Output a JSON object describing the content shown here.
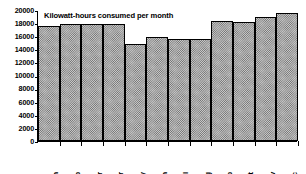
{
  "chart_data": {
    "type": "bar",
    "title": "Kilowatt-hours consumed per month",
    "xlabel": "",
    "ylabel": "",
    "categories": [
      "Jan",
      "Feb",
      "Mar",
      "Apr",
      "May",
      "Jun",
      "Jul",
      "Aug",
      "Sep",
      "Oct",
      "Nov",
      "Dec"
    ],
    "values": [
      17500,
      17900,
      17900,
      17900,
      14800,
      15950,
      15500,
      15550,
      18300,
      18200,
      19000,
      19500
    ],
    "series": [
      {
        "name": "Kilowatt-hours consumed per month",
        "values": [
          17500,
          17900,
          17900,
          17900,
          14800,
          15950,
          15500,
          15550,
          18300,
          18200,
          19000,
          19500
        ]
      }
    ],
    "ylim": [
      0,
      20000
    ],
    "ytick_step": 2000,
    "ytick_labels": [
      "20000",
      "18000",
      "16000",
      "14000",
      "12000",
      "10000",
      "8000",
      "6000",
      "4000",
      "2000",
      "0"
    ],
    "ytick_values": [
      20000,
      18000,
      16000,
      14000,
      12000,
      10000,
      8000,
      6000,
      4000,
      2000,
      0
    ],
    "grid": false,
    "legend": null,
    "legend_position": "none",
    "bar_style": {
      "fill": "hatched-gray",
      "fill_color": "#c9c9c9",
      "hatch_color": "#6d6d6d",
      "edge_color": "#000000",
      "contiguous": true
    },
    "annotations": [],
    "axis_color": "#000000",
    "background_color": "#ffffff",
    "xtick_label_rotation": 90
  }
}
